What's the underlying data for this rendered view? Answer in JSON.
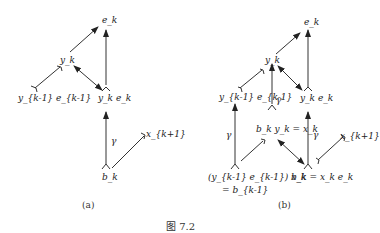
{
  "figure_caption": "图 7.2",
  "panel_a": {
    "caption": "(a)",
    "nodes": {
      "ek": "e_k",
      "yk": "y_k",
      "yk1ek1": "y_{k-1} e_{k-1}",
      "ykek": "y_k e_k",
      "xk1": "x_{k+1}",
      "bk": "b_k",
      "gamma": "γ"
    }
  },
  "panel_b": {
    "caption": "(b)",
    "nodes": {
      "ek": "e_k",
      "yk": "y_k",
      "yk1ek1": "y_{k-1} e_{k-1}",
      "ykek": "y_k e_k",
      "bkyk": "b_k y_k = x_k",
      "left_bottom_1": "(y_{k-1} e_{k-1}) x_k",
      "left_bottom_2": "= b_{k-1}",
      "bk_eq": "b_k = x_k e_k",
      "xk1": "x_{k+1}",
      "gamma_left": "γ",
      "gamma_mid": "γ",
      "gamma_right": "γ"
    }
  }
}
